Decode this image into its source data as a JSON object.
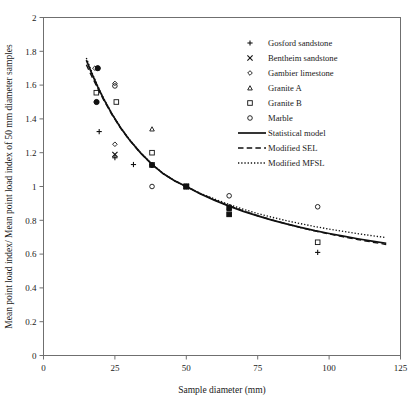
{
  "chart_data": {
    "type": "scatter",
    "title": "",
    "xlabel": "Sample diameter (mm)",
    "ylabel": "Mean point load index/ Mean point load index of 50 mm diameter samples",
    "xlim": [
      0,
      125
    ],
    "ylim": [
      0,
      2
    ],
    "xticks": [
      "0",
      "25",
      "50",
      "75",
      "100",
      "125"
    ],
    "yticks": [
      "0",
      "0.2",
      "0.4",
      "0.6",
      "0.8",
      "1",
      "1.2",
      "1.4",
      "1.6",
      "1.8",
      "2"
    ],
    "grid": false,
    "legend_position": "top-right",
    "series": [
      {
        "name": "Gosford sandstone",
        "marker": "plus",
        "points": [
          {
            "x": 19.5,
            "y": 1.325
          },
          {
            "x": 25.0,
            "y": 1.17
          },
          {
            "x": 31.5,
            "y": 1.13
          },
          {
            "x": 38.0,
            "y": 1.13
          },
          {
            "x": 50.0,
            "y": 1.0
          },
          {
            "x": 65.0,
            "y": 0.875
          },
          {
            "x": 96.0,
            "y": 0.61
          }
        ]
      },
      {
        "name": "Bentheim sandstone",
        "marker": "cross",
        "points": [
          {
            "x": 25.0,
            "y": 1.19
          },
          {
            "x": 50.0,
            "y": 1.0
          },
          {
            "x": 65.0,
            "y": 0.875
          }
        ]
      },
      {
        "name": "Gambier limestone",
        "marker": "diamond",
        "points": [
          {
            "x": 18.0,
            "y": 1.7
          },
          {
            "x": 25.0,
            "y": 1.61
          },
          {
            "x": 25.0,
            "y": 1.25
          },
          {
            "x": 50.0,
            "y": 1.0
          },
          {
            "x": 65.0,
            "y": 0.88
          }
        ]
      },
      {
        "name": "Granite A",
        "marker": "triangle",
        "points": [
          {
            "x": 38.0,
            "y": 1.34
          },
          {
            "x": 50.0,
            "y": 1.0
          },
          {
            "x": 65.0,
            "y": 0.88
          }
        ]
      },
      {
        "name": "Granite B",
        "marker": "square",
        "points": [
          {
            "x": 18.5,
            "y": 1.555
          },
          {
            "x": 25.5,
            "y": 1.5
          },
          {
            "x": 38.0,
            "y": 1.2
          },
          {
            "x": 50.0,
            "y": 1.0
          },
          {
            "x": 65.0,
            "y": 0.835
          },
          {
            "x": 96.0,
            "y": 0.67
          }
        ]
      },
      {
        "name": "Marble",
        "marker": "circle",
        "points": [
          {
            "x": 19.0,
            "y": 1.7
          },
          {
            "x": 18.5,
            "y": 1.5
          },
          {
            "x": 25.0,
            "y": 1.595
          },
          {
            "x": 38.0,
            "y": 1.125
          },
          {
            "x": 38.0,
            "y": 1.0
          },
          {
            "x": 50.0,
            "y": 1.0
          },
          {
            "x": 65.0,
            "y": 0.945
          },
          {
            "x": 96.0,
            "y": 0.88
          }
        ]
      }
    ],
    "lines": [
      {
        "name": "Statistical model",
        "style": "solid",
        "points": [
          {
            "x": 15.0,
            "y": 1.748
          },
          {
            "x": 17.0,
            "y": 1.665
          },
          {
            "x": 19.0,
            "y": 1.59
          },
          {
            "x": 21.0,
            "y": 1.52
          },
          {
            "x": 24.0,
            "y": 1.428
          },
          {
            "x": 27.0,
            "y": 1.348
          },
          {
            "x": 30.0,
            "y": 1.278
          },
          {
            "x": 34.0,
            "y": 1.199
          },
          {
            "x": 38.0,
            "y": 1.131
          },
          {
            "x": 42.0,
            "y": 1.075
          },
          {
            "x": 46.0,
            "y": 1.033
          },
          {
            "x": 50.0,
            "y": 1.0
          },
          {
            "x": 55.0,
            "y": 0.956
          },
          {
            "x": 60.0,
            "y": 0.918
          },
          {
            "x": 65.0,
            "y": 0.884
          },
          {
            "x": 70.0,
            "y": 0.853
          },
          {
            "x": 75.0,
            "y": 0.826
          },
          {
            "x": 80.0,
            "y": 0.801
          },
          {
            "x": 85.0,
            "y": 0.779
          },
          {
            "x": 90.0,
            "y": 0.758
          },
          {
            "x": 95.0,
            "y": 0.739
          },
          {
            "x": 100.0,
            "y": 0.722
          },
          {
            "x": 105.0,
            "y": 0.706
          },
          {
            "x": 110.0,
            "y": 0.691
          },
          {
            "x": 115.0,
            "y": 0.677
          },
          {
            "x": 120.0,
            "y": 0.664
          }
        ]
      },
      {
        "name": "Modified SEL",
        "style": "dashed",
        "points": [
          {
            "x": 15.0,
            "y": 1.72
          },
          {
            "x": 17.0,
            "y": 1.648
          },
          {
            "x": 19.0,
            "y": 1.58
          },
          {
            "x": 21.0,
            "y": 1.514
          },
          {
            "x": 24.0,
            "y": 1.424
          },
          {
            "x": 27.0,
            "y": 1.345
          },
          {
            "x": 30.0,
            "y": 1.276
          },
          {
            "x": 34.0,
            "y": 1.197
          },
          {
            "x": 38.0,
            "y": 1.13
          },
          {
            "x": 42.0,
            "y": 1.074
          },
          {
            "x": 46.0,
            "y": 1.033
          },
          {
            "x": 50.0,
            "y": 1.0
          },
          {
            "x": 55.0,
            "y": 0.957
          },
          {
            "x": 60.0,
            "y": 0.92
          },
          {
            "x": 65.0,
            "y": 0.886
          },
          {
            "x": 70.0,
            "y": 0.855
          },
          {
            "x": 75.0,
            "y": 0.827
          },
          {
            "x": 80.0,
            "y": 0.802
          },
          {
            "x": 85.0,
            "y": 0.779
          },
          {
            "x": 90.0,
            "y": 0.757
          },
          {
            "x": 95.0,
            "y": 0.737
          },
          {
            "x": 100.0,
            "y": 0.719
          },
          {
            "x": 105.0,
            "y": 0.702
          },
          {
            "x": 110.0,
            "y": 0.686
          },
          {
            "x": 115.0,
            "y": 0.671
          },
          {
            "x": 120.0,
            "y": 0.657
          }
        ]
      },
      {
        "name": "Modified MFSL",
        "style": "dotted",
        "points": [
          {
            "x": 15.0,
            "y": 1.76
          },
          {
            "x": 17.0,
            "y": 1.672
          },
          {
            "x": 19.0,
            "y": 1.594
          },
          {
            "x": 21.0,
            "y": 1.523
          },
          {
            "x": 24.0,
            "y": 1.43
          },
          {
            "x": 27.0,
            "y": 1.35
          },
          {
            "x": 30.0,
            "y": 1.28
          },
          {
            "x": 34.0,
            "y": 1.2
          },
          {
            "x": 38.0,
            "y": 1.132
          },
          {
            "x": 42.0,
            "y": 1.076
          },
          {
            "x": 46.0,
            "y": 1.034
          },
          {
            "x": 50.0,
            "y": 1.0
          },
          {
            "x": 55.0,
            "y": 0.96
          },
          {
            "x": 60.0,
            "y": 0.925
          },
          {
            "x": 65.0,
            "y": 0.893
          },
          {
            "x": 70.0,
            "y": 0.865
          },
          {
            "x": 75.0,
            "y": 0.84
          },
          {
            "x": 80.0,
            "y": 0.818
          },
          {
            "x": 85.0,
            "y": 0.798
          },
          {
            "x": 90.0,
            "y": 0.78
          },
          {
            "x": 95.0,
            "y": 0.763
          },
          {
            "x": 100.0,
            "y": 0.748
          },
          {
            "x": 105.0,
            "y": 0.734
          },
          {
            "x": 110.0,
            "y": 0.721
          },
          {
            "x": 115.0,
            "y": 0.709
          },
          {
            "x": 120.0,
            "y": 0.698
          }
        ]
      }
    ]
  },
  "legend": {
    "entries": [
      {
        "label": "Gosford sandstone",
        "marker": "plus"
      },
      {
        "label": "Bentheim sandstone",
        "marker": "cross"
      },
      {
        "label": "Gambier limestone",
        "marker": "diamond"
      },
      {
        "label": "Granite A",
        "marker": "triangle"
      },
      {
        "label": "Granite B",
        "marker": "square"
      },
      {
        "label": "Marble",
        "marker": "circle"
      },
      {
        "label": "Statistical model",
        "marker": "line-solid"
      },
      {
        "label": "Modified SEL",
        "marker": "line-dashed"
      },
      {
        "label": "Modified MFSL",
        "marker": "line-dotted"
      }
    ]
  },
  "colors": {
    "ink": "#111111",
    "frame": "#6f6f6f",
    "background": "#ffffff"
  }
}
